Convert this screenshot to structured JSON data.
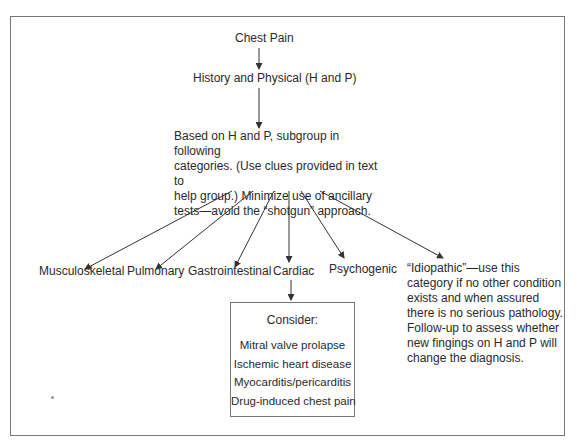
{
  "diagram": {
    "title": "Chest Pain",
    "step2": "History and Physical (H and P)",
    "step3": "Based on H and P, subgroup in following categories. (Use clues provided in text to help group.) Minimize use of ancillary tests—avoid the “shotgun” approach.",
    "step3_lines": [
      "Based on H and P, subgroup in following",
      "categories. (Use clues provided in text to",
      "help group.) Minimize use of ancillary",
      "tests—avoid the “shotgun” approach."
    ],
    "categories": [
      {
        "label": "Musculoskeletal"
      },
      {
        "label": "Pulmonary"
      },
      {
        "label": "Gastrointestinal"
      },
      {
        "label": "Cardiac"
      },
      {
        "label": "Psychogenic"
      }
    ],
    "idiopathic_lines": [
      "“Idiopathic”—use this",
      "category if no other condition",
      "exists and when assured",
      "there is no serious pathology.",
      "Follow-up to assess whether",
      "new fingings on H and P will",
      "change the diagnosis."
    ],
    "consider": {
      "heading": "Consider:",
      "items": [
        "Mitral valve prolapse",
        "Ischemic heart disease",
        "Myocarditis/pericarditis",
        "Drug-induced chest pain"
      ]
    },
    "colors": {
      "line": "#333333",
      "border": "#777777",
      "text": "#2a2a2a"
    }
  }
}
